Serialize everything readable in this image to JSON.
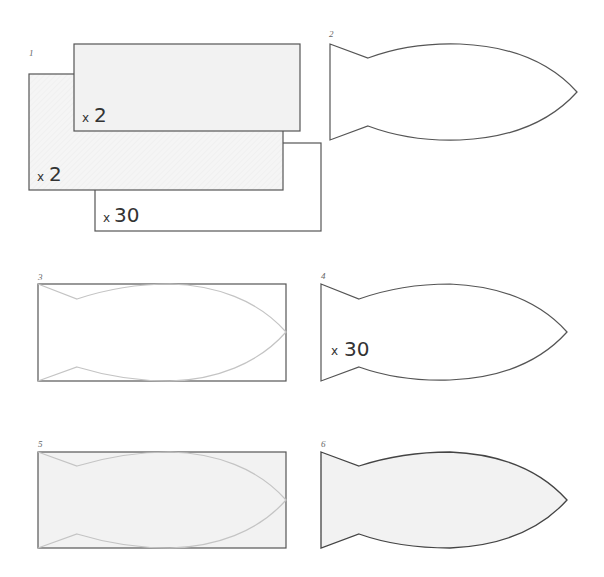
{
  "diagram": {
    "title": "",
    "colors": {
      "outline": "#555555",
      "guide": "#c4c4c4",
      "fill_light": "#f2f2f2",
      "fill_hatched": "#f4f4f4",
      "background": "#ffffff"
    },
    "steps": [
      {
        "number": "1",
        "description": "three stacked rectangles with quantities",
        "pieces": [
          {
            "shape": "rectangle",
            "x_label": "x",
            "quantity": "2",
            "layer": "top"
          },
          {
            "shape": "rectangle",
            "x_label": "x",
            "quantity": "2",
            "layer": "middle"
          },
          {
            "shape": "rectangle",
            "x_label": "x",
            "quantity": "30",
            "layer": "back"
          }
        ]
      },
      {
        "number": "2",
        "description": "fish outline"
      },
      {
        "number": "3",
        "description": "fish traced inside rectangle"
      },
      {
        "number": "4",
        "description": "fish outline with quantity",
        "x_label": "x",
        "quantity": "30"
      },
      {
        "number": "5",
        "description": "fish traced inside filled rectangle"
      },
      {
        "number": "6",
        "description": "filled fish cut out"
      }
    ]
  }
}
